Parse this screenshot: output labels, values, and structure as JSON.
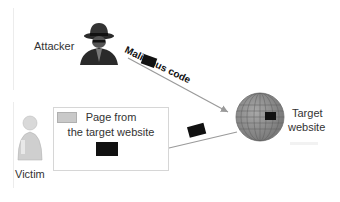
{
  "diagram": {
    "attacker": {
      "label": "Attacker",
      "icon": "hacker-icon"
    },
    "malicious_code": {
      "label": "Malicious code"
    },
    "target": {
      "label_line1": "Target",
      "label_line2": "website",
      "icon": "globe-icon"
    },
    "page": {
      "label_line1": "Page from",
      "label_line2": "the target website",
      "icon": "browser-window-icon"
    },
    "victim": {
      "label": "Victim",
      "icon": "user-icon"
    },
    "colors": {
      "arrow": "#9a9a9a",
      "globe": "#8c8c8c",
      "code_block": "#111111"
    }
  }
}
